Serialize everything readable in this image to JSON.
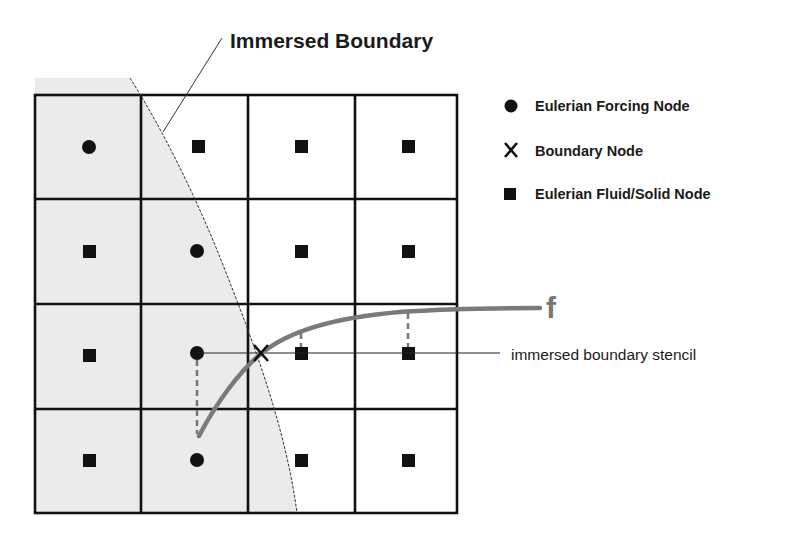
{
  "diagram": {
    "title": "Immersed Boundary",
    "legend": [
      {
        "symbol": "circle",
        "icon": "filled-circle-icon",
        "label": "Eulerian Forcing Node"
      },
      {
        "symbol": "X",
        "icon": "x-mark-icon",
        "label": "Boundary Node"
      },
      {
        "symbol": "square",
        "icon": "filled-square-icon",
        "label": "Eulerian Fluid/Solid Node"
      }
    ],
    "curve_label": "f",
    "stencil_label": "immersed boundary stencil",
    "boundary_glyph": "X",
    "grid": {
      "rows": 4,
      "cols": 4,
      "nodes": [
        [
          "circle",
          "square",
          "square",
          "square"
        ],
        [
          "square",
          "circle",
          "square",
          "square"
        ],
        [
          "square",
          "circle",
          "square",
          "square"
        ],
        [
          "square",
          "circle",
          "square",
          "square"
        ]
      ]
    },
    "colors": {
      "solid_region": "#ebebeb",
      "grid_lines": "#111111",
      "curve": "#7a7a7a",
      "nodes": "#111111"
    }
  }
}
